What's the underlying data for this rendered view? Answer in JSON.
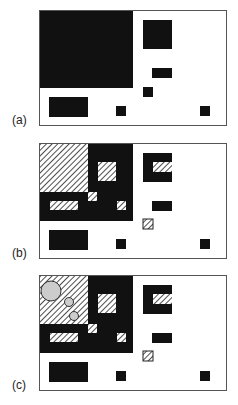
{
  "figure": {
    "panels": [
      {
        "label": "(a)",
        "top": 10,
        "variant": "a"
      },
      {
        "label": "(b)",
        "top": 143,
        "variant": "b"
      },
      {
        "label": "(c)",
        "top": 275,
        "variant": "c"
      }
    ],
    "colors": {
      "fill": "#111111",
      "frame": "#555555",
      "hatch": "#222222",
      "circle_fill": "#cccccc",
      "background": "#ffffff"
    },
    "shapes": {
      "common_black": [
        {
          "x": 103,
          "y": 9,
          "w": 29,
          "h": 29
        },
        {
          "x": 112,
          "y": 57,
          "w": 20,
          "h": 10
        },
        {
          "x": 9,
          "y": 86,
          "w": 39,
          "h": 20
        },
        {
          "x": 76,
          "y": 95,
          "w": 10,
          "h": 10
        },
        {
          "x": 160,
          "y": 95,
          "w": 10,
          "h": 10
        }
      ],
      "a_only_black": [
        {
          "x": 0,
          "y": 0,
          "w": 93,
          "h": 77
        },
        {
          "x": 103,
          "y": 76,
          "w": 10,
          "h": 10
        }
      ],
      "bc_black": [
        {
          "x": 0,
          "y": 0,
          "w": 93,
          "h": 77
        }
      ],
      "bc_hatched": [
        {
          "x": 0,
          "y": 0,
          "w": 48,
          "h": 48
        },
        {
          "x": 58,
          "y": 18,
          "w": 18,
          "h": 19
        },
        {
          "x": 48,
          "y": 48,
          "w": 9,
          "h": 9
        },
        {
          "x": 10,
          "y": 57,
          "w": 28,
          "h": 9
        },
        {
          "x": 77,
          "y": 57,
          "w": 9,
          "h": 9
        },
        {
          "x": 113,
          "y": 18,
          "w": 19,
          "h": 10
        },
        {
          "x": 103,
          "y": 75,
          "w": 10,
          "h": 10,
          "outlined": true
        }
      ],
      "c_circles": [
        {
          "cx": 11,
          "cy": 15,
          "r": 10
        },
        {
          "cx": 29,
          "cy": 26,
          "r": 4.5
        },
        {
          "cx": 34,
          "cy": 40,
          "r": 4.5
        }
      ]
    }
  }
}
